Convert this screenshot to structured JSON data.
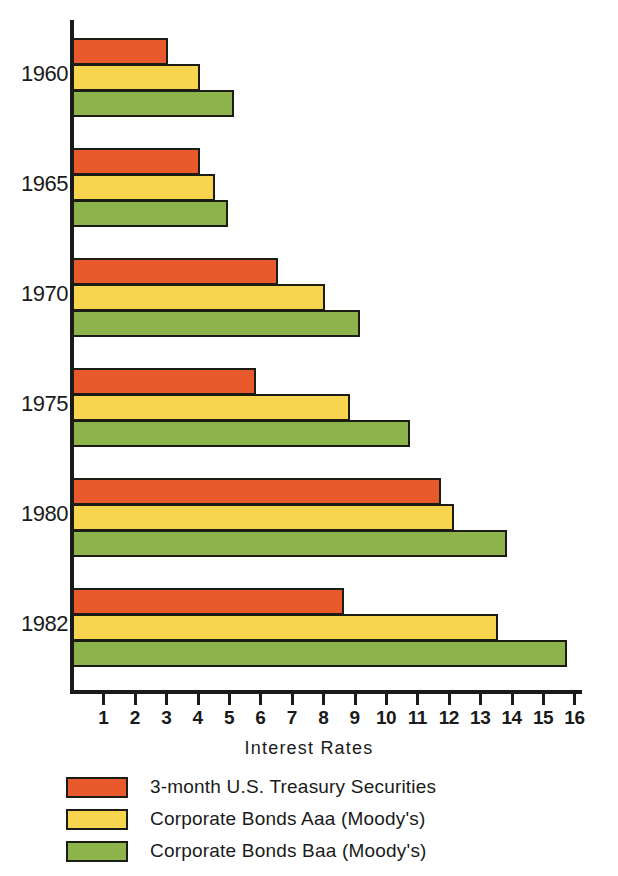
{
  "chart_data": {
    "type": "bar",
    "orientation": "horizontal",
    "title": "",
    "xlabel": "Interest Rates",
    "ylabel": "",
    "categories": [
      "1960",
      "1965",
      "1970",
      "1975",
      "1980",
      "1982"
    ],
    "xlim": [
      0,
      16.5
    ],
    "xticks": [
      1,
      2,
      3,
      4,
      5,
      6,
      7,
      8,
      9,
      10,
      11,
      12,
      13,
      14,
      15,
      16
    ],
    "xtick_labels": [
      "1",
      "2",
      "3",
      "4",
      "5",
      "6",
      "7",
      "8",
      "9",
      "10",
      "11",
      "12",
      "13",
      "14",
      "15",
      "16"
    ],
    "grid": false,
    "legend_position": "bottom-left",
    "series": [
      {
        "name": "3-month U.S. Treasury Securities",
        "color": "#E8592C",
        "values": [
          3.0,
          4.0,
          6.5,
          5.8,
          11.7,
          8.6
        ]
      },
      {
        "name": "Corporate Bonds Aaa (Moody's)",
        "color": "#F7D54E",
        "values": [
          4.0,
          4.5,
          8.0,
          8.8,
          12.1,
          13.5
        ]
      },
      {
        "name": "Corporate Bonds Baa (Moody's)",
        "color": "#8CB44A",
        "values": [
          5.1,
          4.9,
          9.1,
          10.7,
          13.8,
          15.7
        ]
      }
    ]
  },
  "axis": {
    "x_title": "Interest Rates",
    "tick_labels": [
      "1",
      "2",
      "3",
      "4",
      "5",
      "6",
      "7",
      "8",
      "9",
      "10",
      "11",
      "12",
      "13",
      "14",
      "15",
      "16"
    ],
    "year_labels": [
      "1960",
      "1965",
      "1970",
      "1975",
      "1980",
      "1982"
    ]
  },
  "legend": {
    "entries": [
      {
        "label": "3-month U.S. Treasury Securities",
        "color": "#E8592C"
      },
      {
        "label": "Corporate Bonds Aaa (Moody's)",
        "color": "#F7D54E"
      },
      {
        "label": "Corporate Bonds Baa (Moody's)",
        "color": "#8CB44A"
      }
    ]
  },
  "colors": {
    "series_treasury": "#E8592C",
    "series_aaa": "#F7D54E",
    "series_baa": "#8CB44A",
    "outline": "#1c1c14",
    "axis": "#1a1a1a",
    "background": "#ffffff"
  }
}
